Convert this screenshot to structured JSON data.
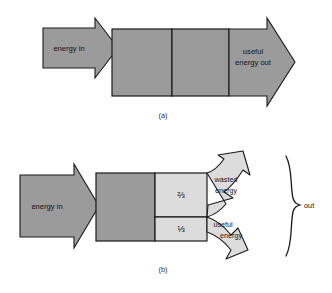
{
  "figure": {
    "background_color": "#ffffff",
    "stroke_color": "#1a1a1a",
    "fill_dark_gray": "#9b9b9b",
    "fill_light_gray": "#dcdcdc",
    "text_color": "#141414"
  },
  "panel_a": {
    "caption": "(a)",
    "energy_in_label": "energy in",
    "useful_energy_out_label_line1": "useful",
    "useful_energy_out_label_line2": "energy out"
  },
  "panel_b": {
    "caption": "(b)",
    "energy_in_label": "energy in",
    "wasted_fraction": "⅔",
    "useful_fraction": "⅓",
    "wasted_energy_label_line1": "wasted",
    "wasted_energy_label_line2": "energy",
    "useful_energy_label_line1": "useful",
    "useful_energy_label_line2": "energy",
    "brace_label": "out"
  }
}
